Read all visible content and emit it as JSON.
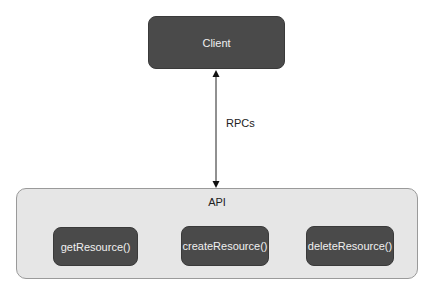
{
  "diagram": {
    "nodes": {
      "client": {
        "label": "Client"
      },
      "api": {
        "label": "API",
        "methods": [
          {
            "label": "getResource()"
          },
          {
            "label": "createResource()"
          },
          {
            "label": "deleteResource()"
          }
        ]
      }
    },
    "edges": [
      {
        "from": "client",
        "to": "api",
        "label": "RPCs",
        "direction": "bidirectional"
      }
    ],
    "colors": {
      "dark_node": "#4a4a4a",
      "container": "#e6e6e6",
      "container_border": "#9a9a9a",
      "arrow": "#222222"
    }
  }
}
